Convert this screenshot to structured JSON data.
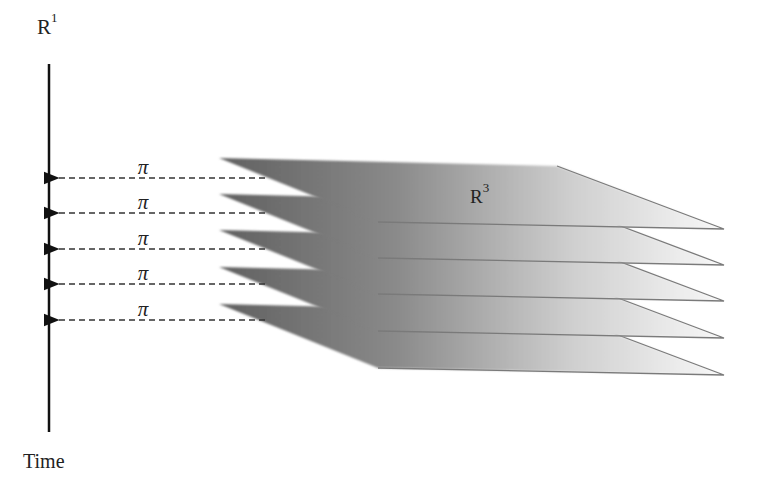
{
  "diagram": {
    "axis": {
      "label_base": "R",
      "label_sup": "1",
      "caption": "Time"
    },
    "space": {
      "label_base": "R",
      "label_sup": "3"
    },
    "projections": [
      {
        "label": "π",
        "y": 178
      },
      {
        "label": "π",
        "y": 213
      },
      {
        "label": "π",
        "y": 249
      },
      {
        "label": "π",
        "y": 284
      },
      {
        "label": "π",
        "y": 320
      }
    ],
    "plane_count": 5,
    "colors": {
      "axis": "#111111",
      "dash": "#333333",
      "plane_dark": "#6e6e6e",
      "plane_light": "#f6f6f6",
      "plane_edge": "#7a7a7a"
    }
  }
}
